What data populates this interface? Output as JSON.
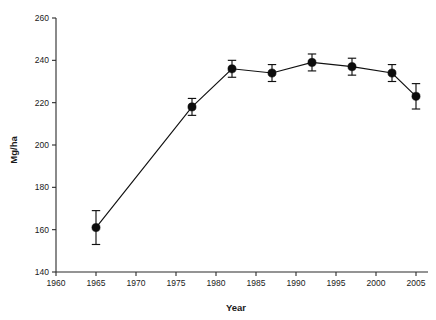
{
  "chart_data": {
    "type": "line",
    "title": "",
    "subtitle": "",
    "xlabel": "Year",
    "ylabel": "Mg/ha",
    "xlim": [
      1960,
      2006.5
    ],
    "ylim": [
      140,
      260
    ],
    "xticks": [
      1960,
      1965,
      1970,
      1975,
      1980,
      1985,
      1990,
      1995,
      2000,
      2005
    ],
    "yticks": [
      140,
      160,
      180,
      200,
      220,
      240,
      260
    ],
    "xtick_labels": [
      "1960",
      "1965",
      "1970",
      "1975",
      "1980",
      "1985",
      "1990",
      "1995",
      "2000",
      "2005"
    ],
    "ytick_labels": [
      "140",
      "160",
      "180",
      "200",
      "220",
      "240",
      "260"
    ],
    "grid": false,
    "legend": null,
    "marker": "filled-circle",
    "error_bars": "vertical-with-caps",
    "x": [
      1965,
      1977,
      1982,
      1987,
      1992,
      1997,
      2002,
      2005
    ],
    "values": [
      161,
      218,
      236,
      234,
      239,
      237,
      234,
      223
    ],
    "yerr": [
      8,
      4,
      4,
      4,
      4,
      4,
      4,
      6
    ],
    "points": [
      {
        "x": 1965,
        "y": 161,
        "err": 8,
        "low": 153,
        "high": 169
      },
      {
        "x": 1977,
        "y": 218,
        "err": 4,
        "low": 214,
        "high": 222
      },
      {
        "x": 1982,
        "y": 236,
        "err": 4,
        "low": 232,
        "high": 240
      },
      {
        "x": 1987,
        "y": 234,
        "err": 4,
        "low": 230,
        "high": 238
      },
      {
        "x": 1992,
        "y": 239,
        "err": 4,
        "low": 235,
        "high": 243
      },
      {
        "x": 1997,
        "y": 237,
        "err": 4,
        "low": 233,
        "high": 241
      },
      {
        "x": 2002,
        "y": 234,
        "err": 4,
        "low": 230,
        "high": 238
      },
      {
        "x": 2005,
        "y": 223,
        "err": 6,
        "low": 217,
        "high": 229
      }
    ],
    "colors": {
      "line": "#111111",
      "marker": "#0d0d0d",
      "axis": "#2a2a2a",
      "background": "#ffffff"
    }
  }
}
